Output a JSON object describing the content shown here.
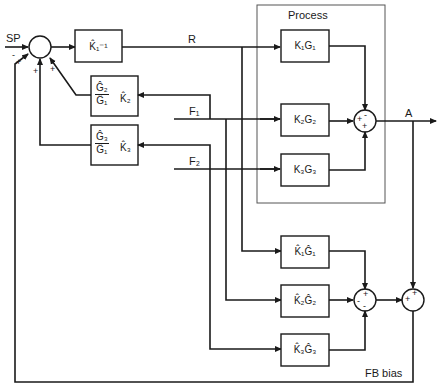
{
  "diagram": {
    "type": "block-diagram",
    "process_box_label": "Process",
    "signals": {
      "setpoint": "SP",
      "r": "R",
      "f1": "F₁",
      "f2": "F₂",
      "a": "A",
      "fb_bias": "FB bias"
    },
    "blocks": {
      "k1_inverse": "K̂₁⁻¹",
      "g2_over_g1_num": "Ĝ₂",
      "g2_over_g1_den": "Ĝ₁",
      "k2_hat": "K̂₂",
      "g3_over_g1_num": "Ĝ₃",
      "g3_over_g1_den": "Ĝ₁",
      "k3_hat": "K̂₃",
      "process_1": "K₁G₁",
      "process_2": "K₂G₂",
      "process_3": "K₃G₃",
      "model_1": "K̂₁Ĝ₁",
      "model_2": "K̂₂Ĝ₂",
      "model_3": "K̂₃Ĝ₃"
    },
    "summing_junctions": {
      "input_sum": {
        "signs": [
          "-",
          "+",
          "+",
          "+"
        ]
      },
      "process_sum": {
        "signs": [
          "-",
          "+",
          "+"
        ]
      },
      "model_sum": {
        "signs": [
          "+",
          "-",
          "-"
        ]
      },
      "bias_sum": {
        "signs": [
          "+",
          "+"
        ]
      }
    }
  }
}
